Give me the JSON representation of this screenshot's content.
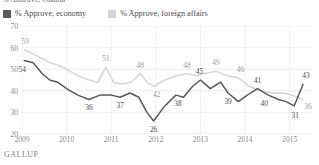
{
  "title_partial": "% Approve, Obama",
  "source": "GALLUP",
  "legend": [
    {
      "label": "% Approve, economy",
      "color": "#595959",
      "key": "economy"
    },
    {
      "label": "% Approve, foreign affairs",
      "color": "#d5d5d5",
      "key": "foreign"
    }
  ],
  "chart_data": {
    "type": "line",
    "title": "% Approve, Obama",
    "xlabel": "",
    "ylabel": "",
    "ylim": [
      20,
      70
    ],
    "yticks": [
      20,
      30,
      40,
      50,
      60,
      70
    ],
    "grid": true,
    "legend_position": "top-left",
    "x": [
      "2009",
      "2010",
      "2011",
      "2012",
      "2013",
      "2014",
      "2015"
    ],
    "xlim": [
      2009,
      2015.5
    ],
    "series": [
      {
        "name": "% Approve, economy",
        "color": "#595959",
        "points": [
          {
            "t": 2009.05,
            "v": 54
          },
          {
            "t": 2009.25,
            "v": 53
          },
          {
            "t": 2009.45,
            "v": 48
          },
          {
            "t": 2009.62,
            "v": 45
          },
          {
            "t": 2009.8,
            "v": 44
          },
          {
            "t": 2010.0,
            "v": 41
          },
          {
            "t": 2010.25,
            "v": 38
          },
          {
            "t": 2010.5,
            "v": 36
          },
          {
            "t": 2010.75,
            "v": 38
          },
          {
            "t": 2011.0,
            "v": 38
          },
          {
            "t": 2011.2,
            "v": 37
          },
          {
            "t": 2011.42,
            "v": 39
          },
          {
            "t": 2011.62,
            "v": 37
          },
          {
            "t": 2011.8,
            "v": 30
          },
          {
            "t": 2011.95,
            "v": 26
          },
          {
            "t": 2012.2,
            "v": 33
          },
          {
            "t": 2012.45,
            "v": 38
          },
          {
            "t": 2012.62,
            "v": 37
          },
          {
            "t": 2012.82,
            "v": 42
          },
          {
            "t": 2013.0,
            "v": 45
          },
          {
            "t": 2013.22,
            "v": 41
          },
          {
            "t": 2013.45,
            "v": 44
          },
          {
            "t": 2013.62,
            "v": 39
          },
          {
            "t": 2013.85,
            "v": 35
          },
          {
            "t": 2014.05,
            "v": 38
          },
          {
            "t": 2014.28,
            "v": 41
          },
          {
            "t": 2014.52,
            "v": 38
          },
          {
            "t": 2014.75,
            "v": 36
          },
          {
            "t": 2014.92,
            "v": 35
          },
          {
            "t": 2015.1,
            "v": 33
          },
          {
            "t": 2015.3,
            "v": 43
          }
        ],
        "labels": [
          {
            "t": 2009.05,
            "v": 54,
            "text": "54",
            "dx": -2,
            "dy": 9
          },
          {
            "t": 2010.5,
            "v": 36,
            "text": "36",
            "dx": 0,
            "dy": 9
          },
          {
            "t": 2011.2,
            "v": 37,
            "text": "37",
            "dx": 0,
            "dy": 9
          },
          {
            "t": 2011.95,
            "v": 26,
            "text": "26",
            "dx": 0,
            "dy": 9
          },
          {
            "t": 2012.45,
            "v": 38,
            "text": "38",
            "dx": 2,
            "dy": 9
          },
          {
            "t": 2013.0,
            "v": 45,
            "text": "45",
            "dx": -1,
            "dy": -8
          },
          {
            "t": 2013.62,
            "v": 39,
            "text": "39",
            "dx": 0,
            "dy": 9
          },
          {
            "t": 2014.28,
            "v": 41,
            "text": "41",
            "dx": 0,
            "dy": -8
          },
          {
            "t": 2014.52,
            "v": 38,
            "text": "40",
            "dx": -4,
            "dy": 9
          },
          {
            "t": 2015.1,
            "v": 33,
            "text": "31",
            "dx": 1,
            "dy": 10
          },
          {
            "t": 2015.3,
            "v": 43,
            "text": "43",
            "dx": 3,
            "dy": -8
          }
        ]
      },
      {
        "name": "% Approve, foreign affairs",
        "color": "#d5d5d5",
        "points": [
          {
            "t": 2009.05,
            "v": 59
          },
          {
            "t": 2009.25,
            "v": 57
          },
          {
            "t": 2009.45,
            "v": 55
          },
          {
            "t": 2009.62,
            "v": 53
          },
          {
            "t": 2009.8,
            "v": 52
          },
          {
            "t": 2010.0,
            "v": 50
          },
          {
            "t": 2010.25,
            "v": 47
          },
          {
            "t": 2010.5,
            "v": 45
          },
          {
            "t": 2010.7,
            "v": 44
          },
          {
            "t": 2010.88,
            "v": 51
          },
          {
            "t": 2011.05,
            "v": 44
          },
          {
            "t": 2011.25,
            "v": 43
          },
          {
            "t": 2011.45,
            "v": 44
          },
          {
            "t": 2011.65,
            "v": 48
          },
          {
            "t": 2011.8,
            "v": 44
          },
          {
            "t": 2011.95,
            "v": 42
          },
          {
            "t": 2012.2,
            "v": 45
          },
          {
            "t": 2012.45,
            "v": 47
          },
          {
            "t": 2012.7,
            "v": 48
          },
          {
            "t": 2012.9,
            "v": 47
          },
          {
            "t": 2013.1,
            "v": 48
          },
          {
            "t": 2013.35,
            "v": 49
          },
          {
            "t": 2013.6,
            "v": 47
          },
          {
            "t": 2013.85,
            "v": 46
          },
          {
            "t": 2014.1,
            "v": 42
          },
          {
            "t": 2014.35,
            "v": 40
          },
          {
            "t": 2014.6,
            "v": 39
          },
          {
            "t": 2014.85,
            "v": 39
          },
          {
            "t": 2015.05,
            "v": 38
          },
          {
            "t": 2015.3,
            "v": 36
          }
        ],
        "labels": [
          {
            "t": 2009.05,
            "v": 59,
            "text": "59",
            "dx": 1,
            "dy": -8
          },
          {
            "t": 2010.88,
            "v": 51,
            "text": "51",
            "dx": 0,
            "dy": -8
          },
          {
            "t": 2011.65,
            "v": 48,
            "text": "48",
            "dx": 0,
            "dy": -8
          },
          {
            "t": 2011.95,
            "v": 42,
            "text": "42",
            "dx": 3,
            "dy": 9
          },
          {
            "t": 2012.7,
            "v": 48,
            "text": "48",
            "dx": 0,
            "dy": -8
          },
          {
            "t": 2013.35,
            "v": 49,
            "text": "49",
            "dx": 0,
            "dy": -8
          },
          {
            "t": 2013.85,
            "v": 46,
            "text": "46",
            "dx": 2,
            "dy": -8
          },
          {
            "t": 2015.3,
            "v": 36,
            "text": "36",
            "dx": 5,
            "dy": 8
          }
        ]
      }
    ]
  }
}
